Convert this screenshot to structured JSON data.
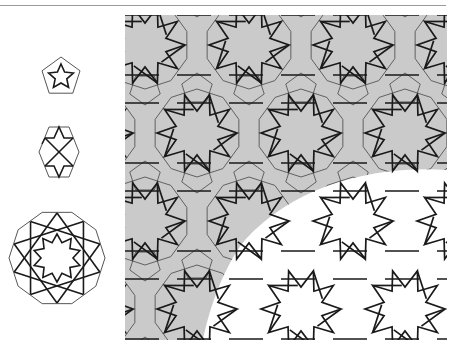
{
  "figure": {
    "colors": {
      "background": "#ffffff",
      "shaded_region": "#cacaca",
      "strapwork_line": "#1a1a1a",
      "tile_outline": "#555555",
      "rule": "#9a9a9a"
    },
    "legend_tiles": [
      {
        "name": "pentagon-tile",
        "sides": 5,
        "star_points": 5
      },
      {
        "name": "hexagon-tile",
        "sides": 6,
        "star_points": 4
      },
      {
        "name": "decagon-tile",
        "sides": 10,
        "star_points": 10
      }
    ],
    "pattern_panel": {
      "regions": [
        "shaded-tiling-region",
        "unshaded-strapwork-region"
      ]
    }
  }
}
